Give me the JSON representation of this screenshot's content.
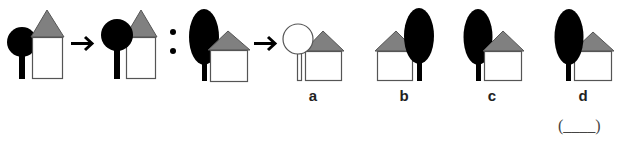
{
  "puzzle": {
    "type": "analogy",
    "colors": {
      "tree": "#000000",
      "roof": "#808080",
      "house_fill": "#ffffff",
      "house_stroke": "#555555",
      "bg": "#ffffff"
    },
    "pair1": [
      {
        "id": "fig1",
        "tree": "round-black",
        "position": "tree-left-behind-house"
      },
      {
        "id": "fig2",
        "tree": "round-black",
        "position": "tree-left-in-front-of-house"
      }
    ],
    "pair2": [
      {
        "id": "fig3",
        "tree": "oval-black",
        "position": "tree-left-behind-house"
      }
    ],
    "arrow_symbol": "→",
    "analogy_symbol": ":",
    "options": [
      {
        "label": "a",
        "tree": "round-white",
        "position": "tree-left-in-front-of-house"
      },
      {
        "label": "b",
        "tree": "oval-black",
        "position": "tree-right-in-front-of-house"
      },
      {
        "label": "c",
        "tree": "oval-black",
        "position": "tree-left-behind-house"
      },
      {
        "label": "d",
        "tree": "oval-black",
        "position": "tree-left-in-front-of-house"
      }
    ],
    "answer_blank": "(____)"
  }
}
